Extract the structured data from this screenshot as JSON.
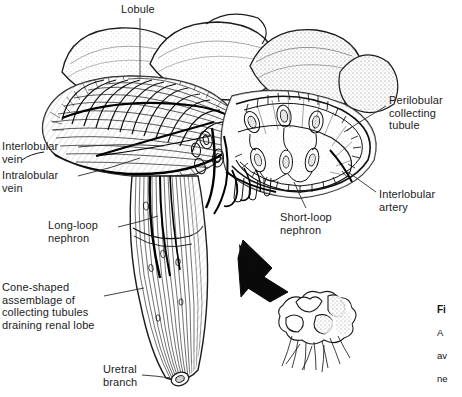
{
  "figure": {
    "background_color": "#ffffff",
    "ink_color": "#1b1b1b",
    "width": 462,
    "height": 397
  },
  "labels": {
    "lobule": "Lobule",
    "interlobular_vein": "Interlobular\nvein",
    "intralobular_vein": "Intralobular\nvein",
    "long_loop_nephron": "Long-loop\nnephron",
    "cone_shaped": "Cone-shaped\nassemblage of\ncollecting tubules\ndraining renal lobe",
    "uretral_branch": "Uretral\nbranch",
    "perilobular_tubule": "Perilobular\ncollecting\ntubule",
    "interlobular_artery": "Interlobular\nartery",
    "short_loop_nephron": "Short-loop\nnephron"
  },
  "caption": {
    "head": "Fi",
    "line1": "A",
    "line2": "av",
    "line3": "ne",
    "line4": "th",
    "source": "Af"
  },
  "inset": {
    "name": "whole-kidney-inset",
    "arrow": "up-left-arrow"
  }
}
